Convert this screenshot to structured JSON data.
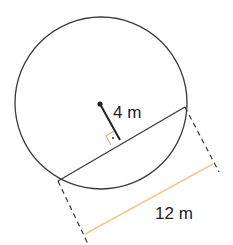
{
  "diagram": {
    "type": "circle-chord-distance",
    "labels": {
      "distance": "4 m",
      "chord_length": "12 m"
    },
    "colors": {
      "stroke": "#3a3a3a",
      "measure_line": "#f5c888",
      "right_angle": "#e8b070",
      "label": "#222222"
    }
  }
}
